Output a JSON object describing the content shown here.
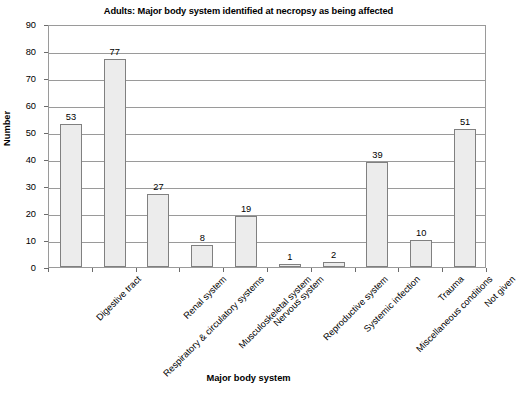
{
  "chart_data": {
    "type": "bar",
    "title": "Adults: Major body system identified at necropsy as being affected",
    "xlabel": "Major body system",
    "ylabel": "Number",
    "ylim": [
      0,
      90
    ],
    "ytick_step": 10,
    "yticks": [
      90,
      80,
      70,
      60,
      50,
      40,
      30,
      20,
      10,
      0
    ],
    "grid": true,
    "legend": "none",
    "categories": [
      "Digestive tract",
      "Respiratory & circulatory systems",
      "Renal system",
      "Musculoskeletal system",
      "Nervous system",
      "Reproductive system",
      "Systemic infection",
      "Miscellaneous conditions",
      "Trauma",
      "Not given"
    ],
    "values": [
      53,
      77,
      27,
      8,
      19,
      1,
      2,
      39,
      10,
      51
    ],
    "data_labels": [
      "53",
      "77",
      "27",
      "8",
      "19",
      "1",
      "2",
      "39",
      "10",
      "51"
    ],
    "bar_fill_color": "#ececec",
    "bar_border_color": "#808080",
    "gridline_color": "#9a9a9a",
    "background_color": "#ffffff",
    "label_rotation_deg": -45
  }
}
